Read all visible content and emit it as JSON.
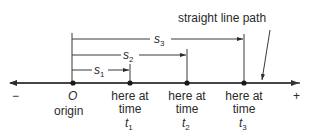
{
  "diagram": {
    "annotation": "straight line path",
    "axis": {
      "negative_sign": "−",
      "positive_sign": "+"
    },
    "origin": {
      "symbol": "O",
      "label": "origin"
    },
    "positions": [
      {
        "line1": "here at",
        "line2": "time",
        "var": "t",
        "sub": "1"
      },
      {
        "line1": "here at",
        "line2": "time",
        "var": "t",
        "sub": "2"
      },
      {
        "line1": "here at",
        "line2": "time",
        "var": "t",
        "sub": "3"
      }
    ],
    "displacements": [
      {
        "var": "s",
        "sub": "1"
      },
      {
        "var": "s",
        "sub": "2"
      },
      {
        "var": "s",
        "sub": "3"
      }
    ],
    "colors": {
      "ink": "#2a2a2a",
      "background": "#ffffff"
    }
  }
}
